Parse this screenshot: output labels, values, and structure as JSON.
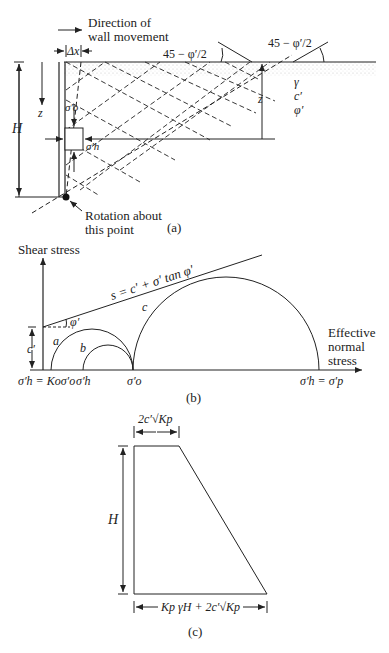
{
  "panel_a": {
    "caption": "(a)",
    "direction_label_1": "Direction of",
    "direction_label_2": "wall movement",
    "delta_x": "Δx",
    "angle_label_left": "45 − φ′/2",
    "angle_label_right": "45 − φ′/2",
    "H": "H",
    "z_left": "z",
    "z_right": "z",
    "sigma_o": "σ′o",
    "sigma_h": "σ′h",
    "gamma": "γ",
    "c_prime": "c′",
    "phi_prime": "φ′",
    "rotation_1": "Rotation about",
    "rotation_2": "this point"
  },
  "panel_b": {
    "caption": "(b)",
    "y_axis": "Shear stress",
    "x_axis_1": "Effective",
    "x_axis_2": "normal",
    "x_axis_3": "stress",
    "envelope": "s = c′ + σ′ tan φ′",
    "phi_label": "φ′",
    "c_label": "c′",
    "circle_a": "a",
    "circle_b": "b",
    "circle_c": "c",
    "x_tick_1": "σ′h = Koσ′o",
    "x_tick_2": "σ′h",
    "x_tick_3": "σ′o",
    "x_tick_4": "σ′h = σ′p"
  },
  "panel_c": {
    "caption": "(c)",
    "top_width": "2c′√Kp",
    "height": "H",
    "bottom_width": "Kp γH + 2c′√Kp"
  }
}
